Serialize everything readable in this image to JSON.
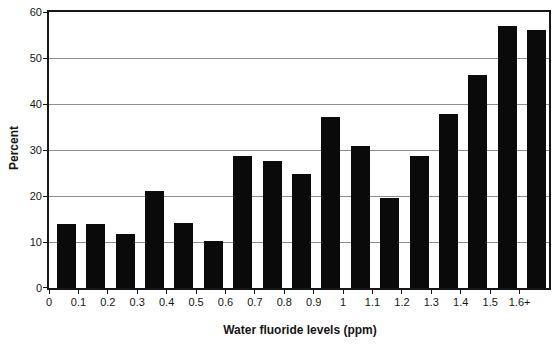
{
  "chart_data": {
    "type": "bar",
    "xlabel": "Water fluoride levels (ppm)",
    "ylabel": "Percent",
    "categories": [
      "0",
      "0.1",
      "0.2",
      "0.3",
      "0.4",
      "0.5",
      "0.6",
      "0.7",
      "0.8",
      "0.9",
      "1",
      "1.1",
      "1.2",
      "1.3",
      "1.4",
      "1.5",
      "1.6+"
    ],
    "values": [
      14,
      14,
      11.8,
      21,
      14.2,
      10.3,
      28.6,
      27.6,
      24.7,
      37.2,
      30.8,
      19.5,
      28.7,
      37.9,
      46.4,
      57,
      56
    ],
    "ylim": [
      0,
      60
    ],
    "yticks": [
      0,
      10,
      20,
      30,
      40,
      50,
      60
    ],
    "grid": "horizontal gridlines at every y tick, plot area fully framed",
    "legend": "none",
    "layout_hint": "histogram style: x tick labels mark bin edges, each bar sits between consecutive ticks",
    "colors": {
      "bar": "#0a0a0a",
      "gridline": "#8e8e8e",
      "axis": "#161616",
      "background": "#ffffff",
      "text": "#161616"
    }
  }
}
